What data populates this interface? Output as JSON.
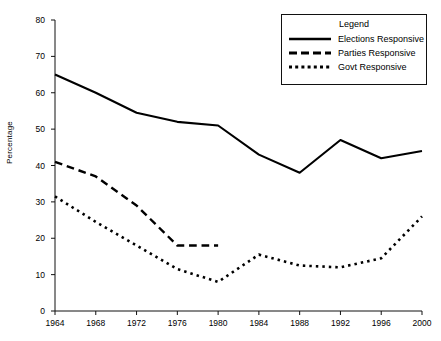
{
  "chart_data": {
    "type": "line",
    "title": "",
    "xlabel": "",
    "ylabel": "Percentage",
    "categories": [
      1964,
      1968,
      1972,
      1976,
      1980,
      1984,
      1988,
      1992,
      1996,
      2000
    ],
    "x_tick_labels": [
      "1964",
      "1968",
      "1972",
      "1976",
      "1980",
      "1984",
      "1988",
      "1992",
      "1996",
      "2000"
    ],
    "y_tick_labels": [
      "0",
      "10",
      "20",
      "30",
      "40",
      "50",
      "60",
      "70",
      "80"
    ],
    "y_ticks": [
      0,
      10,
      20,
      30,
      40,
      50,
      60,
      70,
      80
    ],
    "xlim": [
      1964,
      2000
    ],
    "ylim": [
      0,
      80
    ],
    "grid": false,
    "legend_position": "top-right",
    "series": [
      {
        "name": "Elections Responsive",
        "style": "solid",
        "color": "#000000",
        "x": [
          1964,
          1968,
          1972,
          1976,
          1980,
          1984,
          1988,
          1992,
          1996,
          2000
        ],
        "values": [
          65,
          60,
          54.5,
          52,
          51,
          43,
          38,
          47,
          42,
          44
        ]
      },
      {
        "name": "Parties Responsive",
        "style": "dashed",
        "color": "#000000",
        "x": [
          1964,
          1968,
          1972,
          1976,
          1980
        ],
        "values": [
          41,
          37,
          29,
          18,
          18
        ]
      },
      {
        "name": "Govt Responsive",
        "style": "dotted",
        "color": "#000000",
        "x": [
          1964,
          1968,
          1972,
          1976,
          1980,
          1984,
          1988,
          1992,
          1996,
          2000
        ],
        "values": [
          31.5,
          24.5,
          18,
          11.5,
          8,
          15.5,
          12.5,
          12,
          14.5,
          26
        ]
      }
    ]
  },
  "legend": {
    "title": "Legend",
    "entries": [
      {
        "label": "Elections Responsive",
        "style": "solid"
      },
      {
        "label": "Parties Responsive",
        "style": "dashed"
      },
      {
        "label": "Govt Responsive",
        "style": "dotted"
      }
    ]
  },
  "colors": {
    "axis": "#111111",
    "line": "#000000",
    "background": "#ffffff"
  }
}
